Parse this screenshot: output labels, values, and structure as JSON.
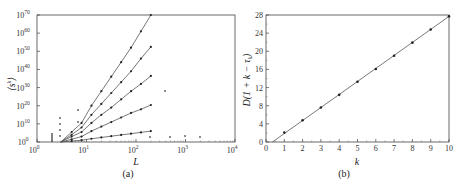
{
  "chart_data": [
    {
      "panel": "a",
      "type": "line",
      "caption": "(a)",
      "xlabel": "L",
      "ylabel": "⟨s^k⟩",
      "xscale": "log",
      "yscale": "log",
      "xlim": [
        1,
        10000
      ],
      "ylim": [
        1,
        1e+70
      ],
      "x_ticks": [
        "10^0",
        "10^1",
        "10^2",
        "10^3",
        "10^4"
      ],
      "y_ticks": [
        "10^0",
        "10^10",
        "10^20",
        "10^30",
        "10^40",
        "10^50",
        "10^60",
        "10^70"
      ],
      "grid": false,
      "series": [
        {
          "name": "line 1 (steepest)",
          "x_log10": [
            0.48,
            0.7,
            0.9,
            1.1,
            1.3,
            1.5,
            1.7,
            1.9,
            2.1,
            2.3
          ],
          "y_log10": [
            0,
            5.5,
            10.5,
            20,
            28,
            36,
            44,
            52,
            61,
            70
          ]
        },
        {
          "name": "line 2",
          "x_log10": [
            0.48,
            0.7,
            0.9,
            1.1,
            1.3,
            1.5,
            1.7,
            1.9,
            2.1,
            2.3
          ],
          "y_log10": [
            0,
            4,
            8,
            15,
            21,
            27,
            33,
            39,
            46,
            52.4
          ]
        },
        {
          "name": "line 3",
          "x_log10": [
            0.48,
            0.7,
            0.9,
            1.1,
            1.3,
            1.5,
            1.7,
            1.9,
            2.1,
            2.3
          ],
          "y_log10": [
            0,
            3,
            5.5,
            10.5,
            15,
            19,
            23.5,
            28,
            32,
            36.4
          ]
        },
        {
          "name": "line 4",
          "x_log10": [
            0.48,
            0.7,
            0.9,
            1.1,
            1.3,
            1.5,
            1.7,
            1.9,
            2.1,
            2.3
          ],
          "y_log10": [
            0,
            1.5,
            3,
            6,
            8.5,
            11,
            13.5,
            16,
            18,
            20.4
          ]
        },
        {
          "name": "line 5 (shallowest)",
          "x_log10": [
            0.48,
            0.7,
            0.9,
            1.1,
            1.3,
            1.5,
            1.7,
            1.9,
            2.1,
            2.3
          ],
          "y_log10": [
            0,
            0.5,
            1,
            1.8,
            2.5,
            3.2,
            3.9,
            4.6,
            5.3,
            6
          ]
        }
      ]
    },
    {
      "panel": "b",
      "type": "scatter",
      "caption": "(b)",
      "xlabel": "k",
      "ylabel": "D(1 + k − τ_k)",
      "xlim": [
        0,
        10
      ],
      "ylim": [
        0,
        28
      ],
      "x_ticks": [
        "0",
        "1",
        "2",
        "3",
        "4",
        "5",
        "6",
        "7",
        "8",
        "9",
        "10"
      ],
      "y_ticks": [
        "0",
        "4",
        "8",
        "12",
        "16",
        "20",
        "24",
        "28"
      ],
      "grid": false,
      "x": [
        1,
        2,
        3,
        4,
        5,
        6,
        7,
        8,
        9,
        10
      ],
      "values": [
        2.1,
        4.8,
        7.6,
        10.4,
        13.3,
        16.1,
        19.0,
        21.9,
        24.8,
        27.7
      ],
      "fit_line": {
        "x": [
          0.35,
          10
        ],
        "y": [
          0,
          27.7
        ]
      }
    }
  ],
  "labels": {
    "a_caption": "(a)",
    "a_xlabel": "L",
    "b_caption": "(b)",
    "b_xlabel": "k",
    "b_ylabel": "D(1 + k − τ",
    "b_ylabel_sub": "k",
    "b_ylabel_end": ")",
    "a_ylabel_s": "s",
    "a_ylabel_k": "k"
  },
  "a_xticks": [
    {
      "base": "10",
      "exp": "0"
    },
    {
      "base": "10",
      "exp": "1"
    },
    {
      "base": "10",
      "exp": "2"
    },
    {
      "base": "10",
      "exp": "3"
    },
    {
      "base": "10",
      "exp": "4"
    }
  ],
  "a_yticks": [
    {
      "base": "10",
      "exp": "0"
    },
    {
      "base": "10",
      "exp": "10"
    },
    {
      "base": "10",
      "exp": "20"
    },
    {
      "base": "10",
      "exp": "30"
    },
    {
      "base": "10",
      "exp": "40"
    },
    {
      "base": "10",
      "exp": "50"
    },
    {
      "base": "10",
      "exp": "60"
    },
    {
      "base": "10",
      "exp": "70"
    }
  ],
  "b_xticks": [
    "0",
    "1",
    "2",
    "3",
    "4",
    "5",
    "6",
    "7",
    "8",
    "9",
    "10"
  ],
  "b_yticks": [
    "0",
    "4",
    "8",
    "12",
    "16",
    "20",
    "24",
    "28"
  ]
}
